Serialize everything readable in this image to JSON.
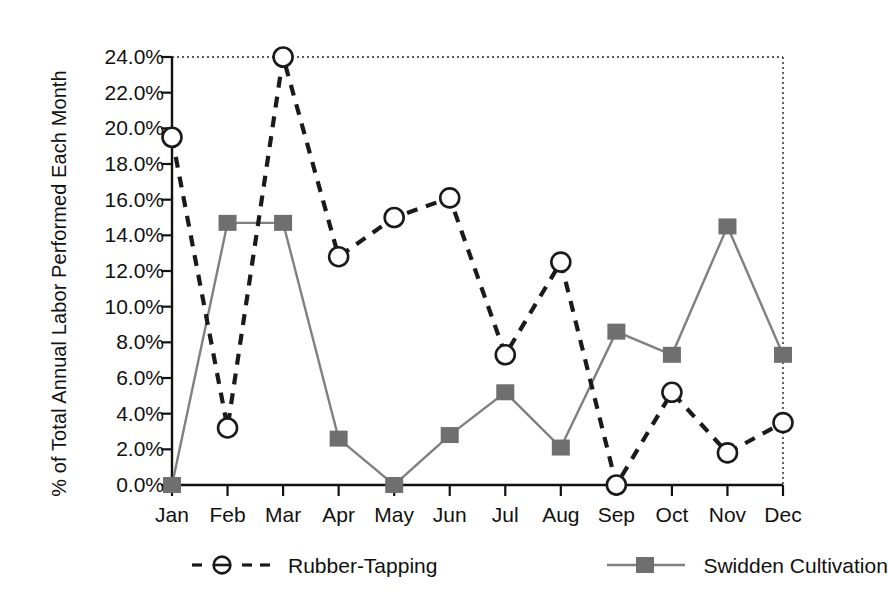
{
  "chart_data": {
    "type": "line",
    "title": "",
    "xlabel": "",
    "ylabel": "% of Total Annual Labor Performed Each Month",
    "categories": [
      "Jan",
      "Feb",
      "Mar",
      "Apr",
      "May",
      "Jun",
      "Jul",
      "Aug",
      "Sep",
      "Oct",
      "Nov",
      "Dec"
    ],
    "ylim": [
      0,
      24
    ],
    "ytick_values": [
      0,
      2,
      4,
      6,
      8,
      10,
      12,
      14,
      16,
      18,
      20,
      22,
      24
    ],
    "ytick_labels": [
      "0.0%",
      "2.0%",
      "4.0%",
      "6.0%",
      "8.0%",
      "10.0%",
      "12.0%",
      "14.0%",
      "16.0%",
      "18.0%",
      "20.0%",
      "22.0%",
      "24.0%"
    ],
    "grid": false,
    "legend_position": "bottom",
    "series": [
      {
        "name": "Rubber-Tapping",
        "marker": "open-circle",
        "line_style": "dashed",
        "color": "#1a1a1a",
        "values": [
          19.5,
          3.2,
          24.0,
          12.8,
          15.0,
          16.1,
          7.3,
          12.5,
          0.0,
          5.2,
          1.8,
          3.5
        ]
      },
      {
        "name": "Swidden Cultivation",
        "marker": "filled-square",
        "line_style": "solid",
        "color": "#808080",
        "values": [
          0.0,
          14.7,
          14.7,
          2.6,
          0.0,
          2.8,
          5.2,
          2.1,
          8.6,
          7.3,
          14.5,
          7.3
        ]
      }
    ]
  },
  "axis": {
    "y_title": "% of Total Annual Labor Performed Each Month"
  },
  "legend": {
    "entries": [
      {
        "label": "Rubber-Tapping"
      },
      {
        "label": "Swidden Cultivation"
      }
    ]
  },
  "colors": {
    "rubber": "#1a1a1a",
    "swidden": "#808080",
    "axis": "#111111",
    "background": "#ffffff"
  }
}
